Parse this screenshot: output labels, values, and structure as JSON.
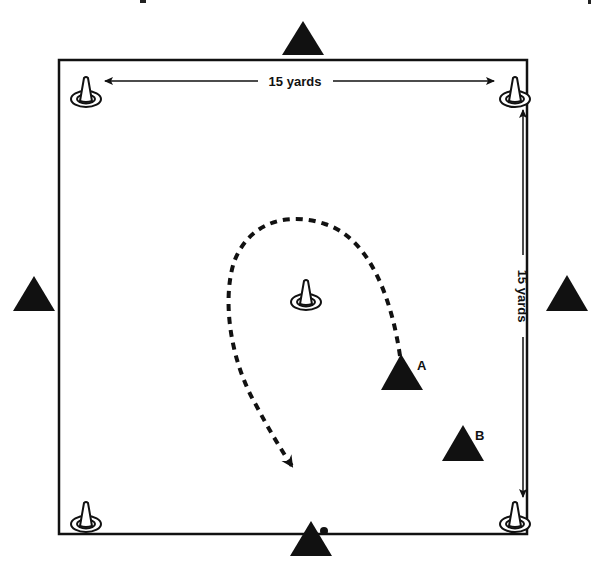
{
  "diagram": {
    "type": "soccer-drill-field",
    "field": {
      "x": 59,
      "y": 60,
      "width": 468,
      "height": 474,
      "stroke": "#111111"
    },
    "dimensions": {
      "horizontal_label": "15 yards",
      "vertical_label": "15 yards"
    },
    "cones": [
      {
        "id": "cone-top-left",
        "x": 86,
        "y": 93
      },
      {
        "id": "cone-top-right",
        "x": 515,
        "y": 93
      },
      {
        "id": "cone-center",
        "x": 306,
        "y": 296
      },
      {
        "id": "cone-bottom-left",
        "x": 86,
        "y": 518
      },
      {
        "id": "cone-bottom-right",
        "x": 515,
        "y": 518
      }
    ],
    "players": [
      {
        "id": "player-top",
        "x": 303,
        "y": 40,
        "label": ""
      },
      {
        "id": "player-left",
        "x": 34,
        "y": 297,
        "label": ""
      },
      {
        "id": "player-right",
        "x": 567,
        "y": 297,
        "label": ""
      },
      {
        "id": "player-bottom",
        "x": 311,
        "y": 543,
        "label": ""
      },
      {
        "id": "player-a",
        "x": 401,
        "y": 375,
        "label": "A"
      },
      {
        "id": "player-b",
        "x": 463,
        "y": 446,
        "label": "B"
      }
    ],
    "ball": {
      "x": 324,
      "y": 531
    },
    "run_path": {
      "style": "dashed",
      "from": "A",
      "arrow": "end"
    },
    "colors": {
      "ink": "#111111",
      "background": "#ffffff"
    }
  }
}
